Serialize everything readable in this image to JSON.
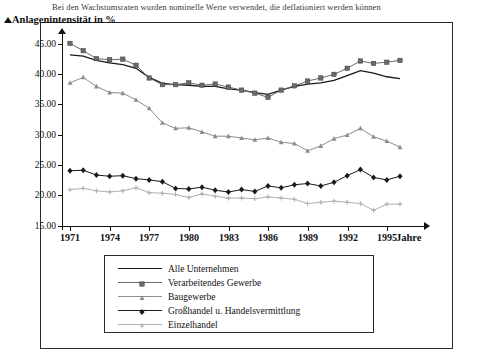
{
  "top_caption": "Bei den Wachstumsraten wurden nominelle Werte verwendet, die deflationiert werden können",
  "axis": {
    "y_title": "Anlagenintensität in %",
    "x_title": "Jahre",
    "y_ticks": [
      "15.00",
      "20.00",
      "25.00",
      "30.00",
      "35.00",
      "40.00",
      "45.00"
    ],
    "x_ticks": [
      "1971",
      "1974",
      "1977",
      "1980",
      "1983",
      "1986",
      "1989",
      "1995"
    ],
    "x_tick_extra": "1992"
  },
  "legend": {
    "items": [
      {
        "label": "Alle Unternehmen",
        "color": "#1a1a1a",
        "marker": "none"
      },
      {
        "label": "Verarbeitendes Gewerbe",
        "color": "#6b6b6b",
        "marker": "square"
      },
      {
        "label": "Baugewerbe",
        "color": "#8c8c8c",
        "marker": "triangle"
      },
      {
        "label": "Großhandel u. Handelsvermittlung",
        "color": "#1a1a1a",
        "marker": "diamond"
      },
      {
        "label": "Einzelhandel",
        "color": "#b0b0b0",
        "marker": "plus"
      }
    ]
  },
  "chart_data": {
    "type": "line",
    "title": "",
    "xlabel": "Jahre",
    "ylabel": "Anlagenintensität in %",
    "ylim": [
      15.0,
      45.0
    ],
    "grid": false,
    "legend_position": "bottom",
    "x": [
      1971,
      1972,
      1973,
      1974,
      1975,
      1976,
      1977,
      1978,
      1979,
      1980,
      1981,
      1982,
      1983,
      1984,
      1985,
      1986,
      1987,
      1988,
      1989,
      1990,
      1991,
      1992,
      1993,
      1994,
      1995,
      1996
    ],
    "series": [
      {
        "name": "Alle Unternehmen",
        "color": "#1a1a1a",
        "marker": "none",
        "values": [
          43.2,
          43.0,
          42.3,
          41.9,
          41.6,
          41.0,
          39.5,
          38.5,
          38.3,
          38.2,
          38.0,
          38.0,
          37.6,
          37.4,
          37.0,
          36.7,
          37.4,
          38.0,
          38.4,
          38.6,
          39.0,
          39.8,
          40.6,
          40.2,
          39.6,
          39.3
        ]
      },
      {
        "name": "Verarbeitendes Gewerbe",
        "color": "#6b6b6b",
        "marker": "square",
        "values": [
          45.1,
          43.9,
          42.6,
          42.4,
          42.5,
          41.5,
          39.4,
          38.3,
          38.3,
          38.6,
          38.2,
          38.4,
          37.9,
          37.4,
          36.9,
          36.2,
          37.4,
          38.1,
          38.9,
          39.4,
          40.0,
          41.0,
          42.2,
          41.8,
          42.0,
          42.3
        ]
      },
      {
        "name": "Baugewerbe",
        "color": "#8c8c8c",
        "marker": "triangle",
        "values": [
          38.6,
          39.5,
          38.0,
          37.0,
          36.9,
          35.8,
          34.4,
          32.0,
          31.1,
          31.2,
          30.5,
          29.8,
          29.8,
          29.5,
          29.2,
          29.5,
          28.8,
          28.6,
          27.4,
          28.2,
          29.4,
          30.0,
          31.1,
          29.7,
          29.0,
          28.0
        ]
      },
      {
        "name": "Großhandel u. Handelsvermittlung",
        "color": "#1a1a1a",
        "marker": "diamond",
        "values": [
          24.1,
          24.2,
          23.4,
          23.2,
          23.3,
          22.8,
          22.6,
          22.3,
          21.2,
          21.1,
          21.4,
          20.9,
          20.6,
          21.0,
          20.7,
          21.6,
          21.3,
          21.8,
          22.0,
          21.6,
          22.2,
          23.3,
          24.3,
          23.0,
          22.6,
          23.2
        ]
      },
      {
        "name": "Einzelhandel",
        "color": "#b0b0b0",
        "marker": "plus",
        "values": [
          21.0,
          21.2,
          20.8,
          20.6,
          20.8,
          21.3,
          20.5,
          20.4,
          20.2,
          19.7,
          20.3,
          19.9,
          19.6,
          19.6,
          19.5,
          19.8,
          19.6,
          19.4,
          18.7,
          18.9,
          19.1,
          18.9,
          18.7,
          17.6,
          18.6,
          18.6
        ]
      }
    ]
  }
}
